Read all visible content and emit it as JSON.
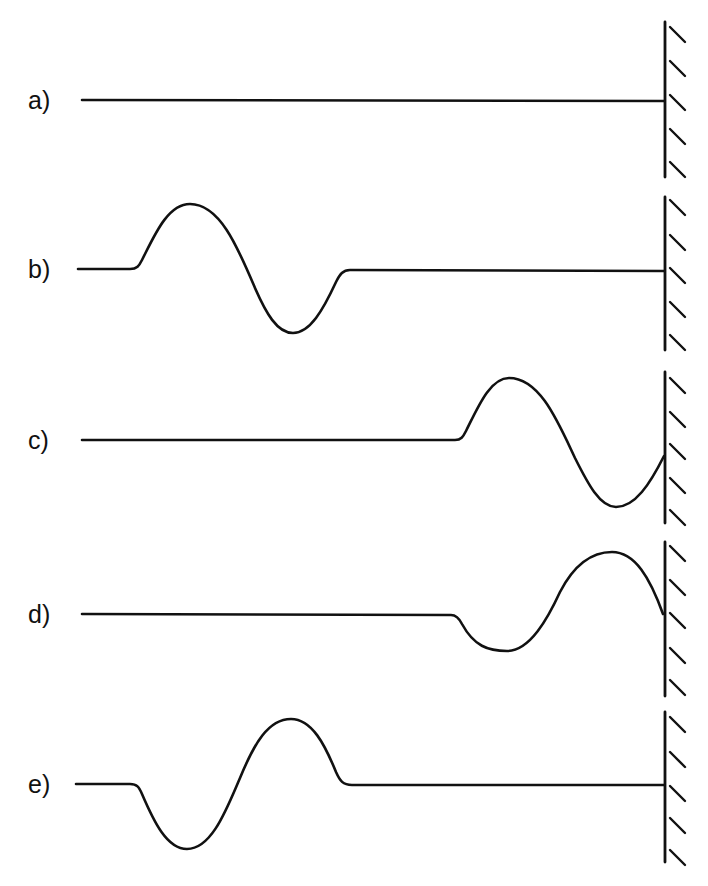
{
  "figure": {
    "colors": {
      "ink": "#111111",
      "background": "#ffffff"
    },
    "panels": [
      {
        "label": "a)",
        "state": "undisturbed string",
        "baseline_y": 100,
        "wall_top": 22,
        "wall_bottom": 177
      },
      {
        "label": "b)",
        "state": "pulse (crest then trough) traveling toward wall",
        "baseline_y": 269,
        "wall_top": 197,
        "wall_bottom": 350
      },
      {
        "label": "c)",
        "state": "pulse reaching the fixed end",
        "baseline_y": 440,
        "wall_top": 372,
        "wall_bottom": 523
      },
      {
        "label": "d)",
        "state": "pulse reflecting with inversion",
        "baseline_y": 614,
        "wall_top": 542,
        "wall_bottom": 696
      },
      {
        "label": "e)",
        "state": "inverted pulse (trough then crest) traveling away from wall",
        "baseline_y": 784,
        "wall_top": 712,
        "wall_bottom": 862
      }
    ]
  }
}
